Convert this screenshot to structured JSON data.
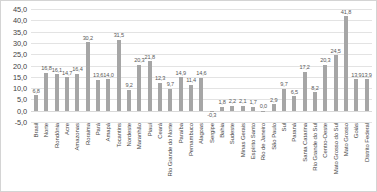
{
  "chart_data": {
    "type": "bar",
    "title": "",
    "subtitle": "",
    "xlabel": "",
    "ylabel": "",
    "ylim": [
      -5.0,
      45.0
    ],
    "ytick_step": 5.0,
    "ytick_labels": [
      "45,0",
      "40,0",
      "35,0",
      "30,0",
      "25,0",
      "20,0",
      "15,0",
      "10,0",
      "5,0",
      "0,0",
      "-5,0"
    ],
    "grid": true,
    "legend": "none",
    "bar_color": "#a6a6a6",
    "decimal_separator": ",",
    "categories": [
      "Brasil",
      "Norte",
      "Rondônia",
      "Acre",
      "Amazonas",
      "Roraima",
      "Pará",
      "Amapá",
      "Tocantins",
      "Nordeste",
      "Maranhão",
      "Piauí",
      "Ceará",
      "Rio Grande do Norte",
      "Paraíba",
      "Pernambuco",
      "Alagoas",
      "Sergipe",
      "Bahia",
      "Sudeste",
      "Minas Gerais",
      "Espírito Santo",
      "Rio de Janeiro",
      "São Paulo",
      "Sul",
      "Paraná",
      "Santa Catarina",
      "Rio Grande do Sul",
      "Centro-Oeste",
      "Mato Grosso do Sul",
      "Mato Grosso",
      "Goiás",
      "Distrito Federal"
    ],
    "values": [
      6.8,
      16.8,
      16.1,
      14.7,
      16.4,
      30.2,
      13.6,
      14.0,
      31.5,
      9.2,
      20.3,
      21.8,
      12.3,
      9.7,
      14.9,
      11.4,
      14.6,
      -0.3,
      1.8,
      2.2,
      2.1,
      1.7,
      0.0,
      2.9,
      9.7,
      6.5,
      17.2,
      8.2,
      20.3,
      24.5,
      41.8,
      13.9,
      13.9
    ],
    "value_labels": [
      "6,8",
      "16,8",
      "16,1",
      "14,7",
      "16,4",
      "30,2",
      "13,6",
      "14,0",
      "31,5",
      "9,2",
      "20,3",
      "21,8",
      "12,3",
      "9,7",
      "14,9",
      "11,4",
      "14,6",
      "-0,3",
      "1,8",
      "2,2",
      "2,1",
      "1,7",
      "0,0",
      "2,9",
      "9,7",
      "6,5",
      "17,2",
      "8,2",
      "20,3",
      "24,5",
      "41,8",
      "13,9",
      "13,9"
    ]
  }
}
